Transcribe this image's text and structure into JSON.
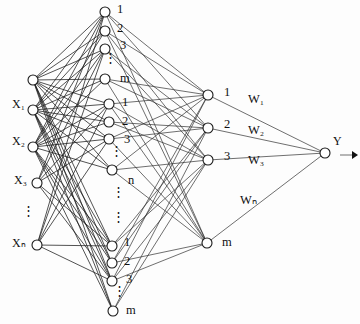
{
  "figure": {
    "type": "feedforward-neural-network",
    "background_color": "#fdfdfd",
    "line_color": "#303030",
    "node_fill": "#ffffff",
    "node_stroke": "#1a1a1a"
  },
  "input_layer": {
    "name": "input-layer",
    "nodes": [
      {
        "id": "in-top",
        "label": "",
        "cx": 33,
        "cy": 80,
        "r": 5
      },
      {
        "id": "in-x1",
        "label": "X",
        "sub": "1",
        "cx": 33,
        "cy": 110,
        "r": 5
      },
      {
        "id": "in-x2",
        "label": "X",
        "sub": "2",
        "cx": 33,
        "cy": 147,
        "r": 5
      },
      {
        "id": "in-x3",
        "label": "X",
        "sub": "3",
        "cx": 37,
        "cy": 183,
        "r": 5
      },
      {
        "id": "in-xn",
        "label": "X",
        "sub": "n",
        "cx": 37,
        "cy": 245,
        "r": 5
      }
    ],
    "labels": [
      {
        "text": "X₁",
        "x": 12,
        "y": 105
      },
      {
        "text": "X₂",
        "x": 12,
        "y": 142
      },
      {
        "text": "X₃",
        "x": 14,
        "y": 181
      },
      {
        "text": "Xₙ",
        "x": 12,
        "y": 244
      }
    ],
    "ellipsis": {
      "text": "⋮",
      "x": 22,
      "y": 215
    }
  },
  "hidden_layer_group_1": {
    "name": "hidden-group-1",
    "nodes": [
      {
        "id": "h1-1",
        "label": "1",
        "cx": 105,
        "cy": 12,
        "r": 5
      },
      {
        "id": "h1-2",
        "label": "2",
        "cx": 105,
        "cy": 31,
        "r": 5
      },
      {
        "id": "h1-3",
        "label": "3",
        "cx": 105,
        "cy": 49,
        "r": 5
      },
      {
        "id": "h1-m",
        "label": "m",
        "cx": 105,
        "cy": 79,
        "r": 5
      }
    ],
    "labels": [
      {
        "text": "1",
        "x": 117,
        "y": 10
      },
      {
        "text": "2",
        "x": 117,
        "y": 29
      },
      {
        "text": "3",
        "x": 120,
        "y": 46
      },
      {
        "text": "m",
        "x": 120,
        "y": 79
      }
    ],
    "ellipsis": {
      "text": "⋮",
      "x": 104,
      "y": 62
    }
  },
  "hidden_layer_group_2": {
    "name": "hidden-group-2",
    "nodes": [
      {
        "id": "h2-1",
        "label": "1",
        "cx": 109,
        "cy": 104,
        "r": 5
      },
      {
        "id": "h2-2",
        "label": "2",
        "cx": 109,
        "cy": 122,
        "r": 5
      },
      {
        "id": "h2-3",
        "label": "3",
        "cx": 109,
        "cy": 139,
        "r": 5
      },
      {
        "id": "h2-n",
        "label": "n",
        "cx": 112,
        "cy": 170,
        "r": 5
      }
    ],
    "labels": [
      {
        "text": "1",
        "x": 122,
        "y": 103
      },
      {
        "text": "2",
        "x": 122,
        "y": 122
      },
      {
        "text": "3",
        "x": 124,
        "y": 140
      },
      {
        "text": "n",
        "x": 128,
        "y": 181
      }
    ],
    "ellipsis": {
      "text": "⋮",
      "x": 110,
      "y": 155
    },
    "ellipsis2": {
      "text": "⋮",
      "x": 112,
      "y": 196
    },
    "ellipsis3": {
      "text": "⋮",
      "x": 112,
      "y": 221
    }
  },
  "hidden_layer_group_3": {
    "name": "hidden-group-3",
    "nodes": [
      {
        "id": "h3-1",
        "label": "1",
        "cx": 112,
        "cy": 246,
        "r": 5
      },
      {
        "id": "h3-2",
        "label": "2",
        "cx": 112,
        "cy": 263,
        "r": 5
      },
      {
        "id": "h3-3",
        "label": "3",
        "cx": 112,
        "cy": 281,
        "r": 5
      },
      {
        "id": "h3-m",
        "label": "m",
        "cx": 113,
        "cy": 311,
        "r": 5
      }
    ],
    "labels": [
      {
        "text": "1",
        "x": 124,
        "y": 243
      },
      {
        "text": "2",
        "x": 124,
        "y": 262
      },
      {
        "text": "3",
        "x": 126,
        "y": 280
      },
      {
        "text": "m",
        "x": 126,
        "y": 311
      }
    ],
    "ellipsis": {
      "text": "⋮",
      "x": 113,
      "y": 295
    }
  },
  "output_hidden_layer": {
    "name": "summation-layer",
    "nodes": [
      {
        "id": "s-1",
        "label": "1",
        "cx": 208,
        "cy": 95,
        "r": 5
      },
      {
        "id": "s-2",
        "label": "2",
        "cx": 208,
        "cy": 128,
        "r": 5
      },
      {
        "id": "s-3",
        "label": "3",
        "cx": 208,
        "cy": 160,
        "r": 5
      },
      {
        "id": "s-m",
        "label": "m",
        "cx": 207,
        "cy": 243,
        "r": 5
      }
    ],
    "labels": [
      {
        "text": "1",
        "x": 224,
        "y": 93
      },
      {
        "text": "2",
        "x": 224,
        "y": 125
      },
      {
        "text": "3",
        "x": 224,
        "y": 157
      },
      {
        "text": "m",
        "x": 222,
        "y": 243
      }
    ]
  },
  "weights": [
    {
      "id": "w1",
      "text": "W₁",
      "x": 248,
      "y": 100
    },
    {
      "id": "w2",
      "text": "W₂",
      "x": 248,
      "y": 131
    },
    {
      "id": "w3",
      "text": "W₃",
      "x": 248,
      "y": 161
    },
    {
      "id": "wn",
      "text": "Wₙ",
      "x": 240,
      "y": 201
    }
  ],
  "output": {
    "name": "output-node",
    "node": {
      "id": "y",
      "cx": 325,
      "cy": 153,
      "r": 5
    },
    "label": {
      "text": "Y",
      "x": 333,
      "y": 142
    },
    "arrow": {
      "x1": 340,
      "y1": 155,
      "x2": 355,
      "y2": 155
    }
  },
  "chart_data": {
    "type": "diagram",
    "layers": [
      {
        "name": "input",
        "labels": [
          "X1",
          "X2",
          "X3",
          "Xn"
        ],
        "count": 5
      },
      {
        "name": "hidden-group-1",
        "labels": [
          "1",
          "2",
          "3",
          "m"
        ],
        "count": 4
      },
      {
        "name": "hidden-group-2",
        "labels": [
          "1",
          "2",
          "3",
          "n"
        ],
        "count": 4
      },
      {
        "name": "hidden-group-3",
        "labels": [
          "1",
          "2",
          "3",
          "m"
        ],
        "count": 4
      },
      {
        "name": "summation",
        "labels": [
          "1",
          "2",
          "3",
          "m"
        ],
        "count": 4
      },
      {
        "name": "output",
        "labels": [
          "Y"
        ],
        "count": 1
      }
    ],
    "weights": [
      "W1",
      "W2",
      "W3",
      "Wn"
    ],
    "output_label": "Y"
  }
}
